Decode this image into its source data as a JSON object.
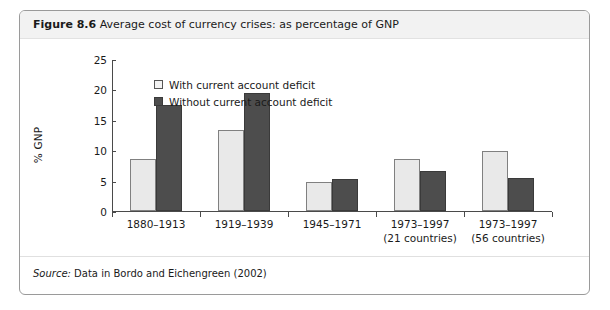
{
  "figure": {
    "number_label": "Figure 8.6",
    "title": "Average cost of currency crises: as percentage of GNP",
    "source_label": "Source:",
    "source_text": " Data in Bordo and Eichengreen (2002)"
  },
  "colors": {
    "series_light_fill": "#e9e9e9",
    "series_light_border": "#808080",
    "series_dark_fill": "#4d4d4d",
    "series_dark_border": "#3a3a3a",
    "frame_border": "#9a9a9a",
    "header_band": "#f2f2f2",
    "axis": "#4a4a4a",
    "text": "#1a1a1a"
  },
  "chart_data": {
    "type": "bar",
    "title": "Average cost of currency crises: as percentage of GNP",
    "xlabel": "",
    "ylabel": "% GNP",
    "ylim": [
      0,
      25
    ],
    "yticks": [
      0,
      5,
      10,
      15,
      20,
      25
    ],
    "ytick_labels": [
      "0",
      "5",
      "10",
      "15",
      "20",
      "25"
    ],
    "grid": false,
    "legend_position": "top-left-inside",
    "categories": [
      "1880–1913",
      "1919–1939",
      "1945–1971",
      "1973–1997",
      "1973–1997"
    ],
    "category_sublabels": [
      "",
      "",
      "",
      "(21 countries)",
      "(56 countries)"
    ],
    "series": [
      {
        "name": "With current account deficit",
        "color": "#e9e9e9",
        "values": [
          8.6,
          13.4,
          4.7,
          8.5,
          9.8
        ]
      },
      {
        "name": "Without current account deficit",
        "color": "#4d4d4d",
        "values": [
          17.5,
          19.4,
          5.3,
          6.5,
          5.4
        ]
      }
    ]
  }
}
